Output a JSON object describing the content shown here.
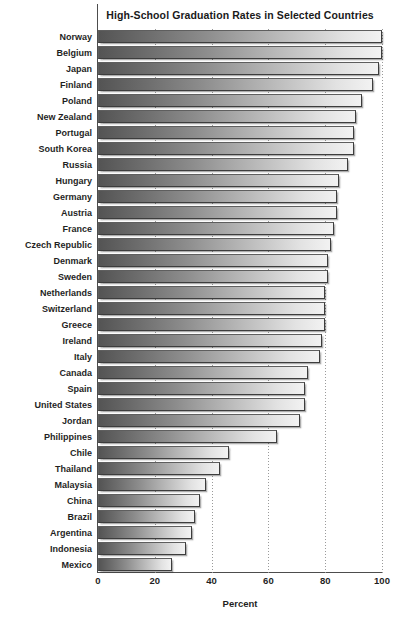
{
  "chart_data": {
    "type": "bar",
    "orientation": "horizontal",
    "title": "High-School Graduation Rates in Selected Countries",
    "xlabel": "Percent",
    "ylabel": "",
    "xlim": [
      0,
      100
    ],
    "xticks": [
      0,
      20,
      40,
      60,
      80,
      100
    ],
    "grid": "vertical-dotted",
    "legend": "none",
    "categories": [
      "Norway",
      "Belgium",
      "Japan",
      "Finland",
      "Poland",
      "New Zealand",
      "Portugal",
      "South Korea",
      "Russia",
      "Hungary",
      "Germany",
      "Austria",
      "France",
      "Czech Republic",
      "Denmark",
      "Sweden",
      "Netherlands",
      "Switzerland",
      "Greece",
      "Ireland",
      "Italy",
      "Canada",
      "Spain",
      "United States",
      "Jordan",
      "Philippines",
      "Chile",
      "Thailand",
      "Malaysia",
      "China",
      "Brazil",
      "Argentina",
      "Indonesia",
      "Mexico"
    ],
    "values": [
      100,
      100,
      99,
      97,
      93,
      91,
      90,
      90,
      88,
      85,
      84,
      84,
      83,
      82,
      81,
      81,
      80,
      80,
      80,
      79,
      78,
      74,
      73,
      73,
      71,
      63,
      46,
      43,
      38,
      36,
      34,
      33,
      31,
      26
    ]
  },
  "axis": {
    "x_tick_labels": [
      "0",
      "20",
      "40",
      "60",
      "80",
      "100"
    ],
    "x_title": "Percent"
  },
  "colors": {
    "bar_gradient_start": "#545454",
    "bar_gradient_end": "#f2f2f2",
    "bar_border": "#5e5e5e",
    "gridline": "#9a9a9a",
    "axis": "#4d4d4d",
    "text": "#1f1f1f",
    "background": "#ffffff"
  }
}
